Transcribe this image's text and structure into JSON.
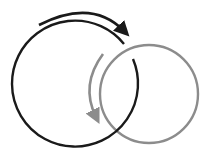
{
  "diagram": {
    "elements": [
      {
        "id": "black-circle",
        "label": "",
        "color": "#1a1a1a"
      },
      {
        "id": "gray-circle",
        "label": "",
        "color": "#8c8c8c"
      },
      {
        "id": "black-arrow",
        "direction": "clockwise",
        "color": "#1a1a1a"
      },
      {
        "id": "gray-arrow",
        "direction": "counterclockwise",
        "color": "#8c8c8c"
      }
    ],
    "colors": {
      "dark": "#1a1a1a",
      "gray": "#8c8c8c",
      "background": "#ffffff"
    }
  }
}
